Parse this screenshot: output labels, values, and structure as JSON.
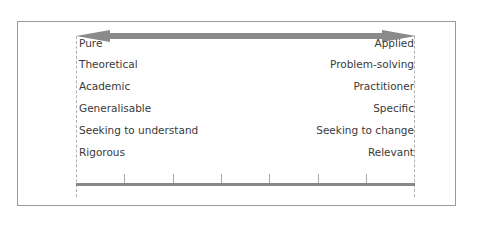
{
  "diagram": {
    "title": "",
    "arrow": {
      "type": "double-headed",
      "color": "#888888"
    },
    "left_pole": {
      "labels": [
        "Pure",
        "Theoretical",
        "Academic",
        "Generalisable",
        "Seeking to understand",
        "Rigorous"
      ]
    },
    "right_pole": {
      "labels": [
        "Applied",
        "Problem-solving",
        "Practitioner",
        "Specific",
        "Seeking to change",
        "Relevant"
      ]
    },
    "scale": {
      "tick_count": 6,
      "color": "#888888"
    },
    "colors": {
      "text": "#3a3a3a",
      "frame_border": "#9a9a9a",
      "dashed_guides": "#b0b0b0"
    }
  }
}
